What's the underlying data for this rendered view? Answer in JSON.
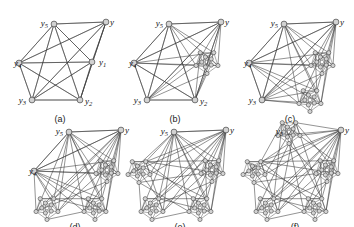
{
  "figure": {
    "background_color": "#ffffff",
    "node_fill": "#d2d2d2",
    "node_stroke": "#2b2b2b",
    "edge_color": "#3a3a3a",
    "label_color": "#111111"
  },
  "panels": [
    {
      "id": "a",
      "caption": "(a)",
      "origin": [
        6,
        8
      ],
      "size": [
        108,
        100
      ],
      "replaced_count": 0,
      "description": "Complete graph on six vertices with apex y and cycle vertices y1..y5",
      "labels": [
        {
          "name": "y",
          "base": "y",
          "sub": "",
          "x": 104,
          "y": 17,
          "anchor": "start"
        },
        {
          "name": "y5",
          "base": "y",
          "sub": "5",
          "x": 42,
          "y": 18,
          "anchor": "end"
        },
        {
          "name": "y4",
          "base": "y",
          "sub": "4",
          "x": 8,
          "y": 58,
          "anchor": "start"
        },
        {
          "name": "y1",
          "base": "y",
          "sub": "1",
          "x": 93,
          "y": 57,
          "anchor": "start"
        },
        {
          "name": "y3",
          "base": "y",
          "sub": "3",
          "x": 20,
          "y": 95,
          "anchor": "end"
        },
        {
          "name": "y2",
          "base": "y",
          "sub": "2",
          "x": 79,
          "y": 96,
          "anchor": "start"
        }
      ]
    },
    {
      "id": "b",
      "caption": "(b)",
      "origin": [
        121,
        8
      ],
      "size": [
        108,
        100
      ],
      "replaced_count": 1,
      "description": "Vertex y1 replaced by a cluster copy",
      "labels": [
        {
          "name": "y",
          "base": "y",
          "sub": "",
          "x": 104,
          "y": 17,
          "anchor": "start"
        },
        {
          "name": "y5",
          "base": "y",
          "sub": "5",
          "x": 42,
          "y": 18,
          "anchor": "end"
        },
        {
          "name": "y4",
          "base": "y",
          "sub": "4",
          "x": 8,
          "y": 58,
          "anchor": "start"
        },
        {
          "name": "y3",
          "base": "y",
          "sub": "3",
          "x": 20,
          "y": 95,
          "anchor": "end"
        },
        {
          "name": "y2",
          "base": "y",
          "sub": "2",
          "x": 79,
          "y": 96,
          "anchor": "start"
        }
      ]
    },
    {
      "id": "c",
      "caption": "(c)",
      "origin": [
        236,
        8
      ],
      "size": [
        108,
        100
      ],
      "replaced_count": 2,
      "description": "Vertices y1 and y2 replaced by cluster copies",
      "labels": [
        {
          "name": "y",
          "base": "y",
          "sub": "",
          "x": 104,
          "y": 17,
          "anchor": "start"
        },
        {
          "name": "y5",
          "base": "y",
          "sub": "5",
          "x": 42,
          "y": 18,
          "anchor": "end"
        },
        {
          "name": "y4",
          "base": "y",
          "sub": "4",
          "x": 8,
          "y": 58,
          "anchor": "start"
        },
        {
          "name": "y3",
          "base": "y",
          "sub": "3",
          "x": 20,
          "y": 95,
          "anchor": "end"
        }
      ]
    },
    {
      "id": "d",
      "caption": "(d)",
      "origin": [
        21,
        116
      ],
      "size": [
        108,
        100
      ],
      "replaced_count": 3,
      "description": "Vertices y1, y2 and y3 replaced by cluster copies",
      "labels": [
        {
          "name": "y",
          "base": "y",
          "sub": "",
          "x": 104,
          "y": 17,
          "anchor": "start"
        },
        {
          "name": "y5",
          "base": "y",
          "sub": "5",
          "x": 42,
          "y": 18,
          "anchor": "end"
        },
        {
          "name": "y4",
          "base": "y",
          "sub": "4",
          "x": 8,
          "y": 58,
          "anchor": "start"
        }
      ]
    },
    {
      "id": "e",
      "caption": "(e)",
      "origin": [
        126,
        116
      ],
      "size": [
        108,
        100
      ],
      "replaced_count": 4,
      "description": "Vertices y1 through y4 replaced by cluster copies",
      "labels": [
        {
          "name": "y",
          "base": "y",
          "sub": "",
          "x": 104,
          "y": 17,
          "anchor": "start"
        },
        {
          "name": "y5",
          "base": "y",
          "sub": "5",
          "x": 42,
          "y": 18,
          "anchor": "end"
        }
      ]
    },
    {
      "id": "f",
      "caption": "(f)",
      "origin": [
        241,
        116
      ],
      "size": [
        108,
        100
      ],
      "replaced_count": 5,
      "description": "All five vertices y1 through y5 replaced by cluster copies",
      "labels": [
        {
          "name": "y",
          "base": "y",
          "sub": "",
          "x": 104,
          "y": 17,
          "anchor": "start"
        },
        {
          "name": "y5",
          "base": "y",
          "sub": "5",
          "x": 42,
          "y": 18,
          "anchor": "end"
        }
      ]
    }
  ],
  "geometry": {
    "base_nodes": {
      "y": [
        100,
        14
      ],
      "y5": [
        48,
        16
      ],
      "y4": [
        13,
        55
      ],
      "y1": [
        86,
        54
      ],
      "y3": [
        26,
        92
      ],
      "y2": [
        74,
        92
      ]
    },
    "base_edges": [
      [
        "y",
        "y5"
      ],
      [
        "y",
        "y4"
      ],
      [
        "y",
        "y1"
      ],
      [
        "y",
        "y3"
      ],
      [
        "y",
        "y2"
      ],
      [
        "y5",
        "y4"
      ],
      [
        "y5",
        "y1"
      ],
      [
        "y5",
        "y3"
      ],
      [
        "y5",
        "y2"
      ],
      [
        "y4",
        "y1"
      ],
      [
        "y4",
        "y3"
      ],
      [
        "y4",
        "y2"
      ],
      [
        "y1",
        "y3"
      ],
      [
        "y1",
        "y2"
      ],
      [
        "y3",
        "y2"
      ]
    ],
    "cluster": {
      "radius": 13,
      "node_radius": 2.1,
      "inner_nodes": 5,
      "inner_ring_radius": 5.2,
      "outer_nodes": 5,
      "outer_ring_radius": 11.5,
      "description": "Each replacement cluster is a small complete-like graph of ten shaded vertices arranged in two concentric pentagonal rings"
    },
    "replacement_order": [
      "y1",
      "y2",
      "y3",
      "y4",
      "y5"
    ]
  },
  "caption_offset_y": 114
}
